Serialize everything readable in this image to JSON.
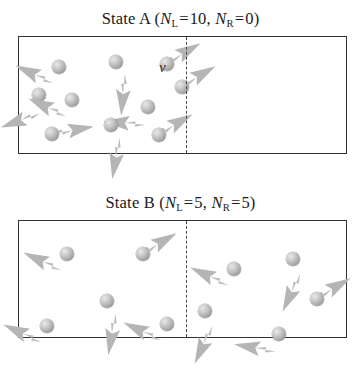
{
  "figure": {
    "background_color": "#ffffff",
    "box_border_color": "#333333",
    "divider_style": "dashed",
    "particle_color": "#ababab",
    "arrow_color": "#b0b0b0"
  },
  "states": [
    {
      "id": "state-a",
      "title": {
        "prefix": "State A (",
        "n_symbol": "N",
        "left_sub": "L",
        "equals": "=",
        "left_count": "10",
        "comma": ", ",
        "right_sub": "R",
        "right_count": "0",
        "suffix": ")"
      },
      "velocity_label": "v",
      "left_particles": [
        {
          "x": 40,
          "y": 30,
          "angle": 205
        },
        {
          "x": 97,
          "y": 25,
          "angle": 95
        },
        {
          "x": 148,
          "y": 27,
          "angle": 330
        },
        {
          "x": 20,
          "y": 58,
          "angle": 160
        },
        {
          "x": 53,
          "y": 63,
          "angle": 205
        },
        {
          "x": 129,
          "y": 70,
          "angle": 185
        },
        {
          "x": 163,
          "y": 50,
          "angle": 330
        },
        {
          "x": 33,
          "y": 97,
          "angle": 350
        },
        {
          "x": 92,
          "y": 88,
          "angle": 100
        },
        {
          "x": 140,
          "y": 98,
          "angle": 330
        }
      ],
      "right_particles": []
    },
    {
      "id": "state-b",
      "title": {
        "prefix": "State B (",
        "n_symbol": "N",
        "left_sub": "L",
        "equals": "=",
        "left_count": "5",
        "comma": ", ",
        "right_sub": "R",
        "right_count": "5",
        "suffix": ")"
      },
      "velocity_label": "",
      "left_particles": [
        {
          "x": 48,
          "y": 33,
          "angle": 205
        },
        {
          "x": 124,
          "y": 33,
          "angle": 330
        },
        {
          "x": 88,
          "y": 80,
          "angle": 100
        },
        {
          "x": 28,
          "y": 105,
          "angle": 205
        },
        {
          "x": 148,
          "y": 103,
          "angle": 205
        }
      ],
      "right_particles": [
        {
          "x": 48,
          "y": 48,
          "angle": 205
        },
        {
          "x": 107,
          "y": 38,
          "angle": 115
        },
        {
          "x": 19,
          "y": 90,
          "angle": 115
        },
        {
          "x": 131,
          "y": 78,
          "angle": 330
        },
        {
          "x": 93,
          "y": 113,
          "angle": 190
        }
      ]
    }
  ]
}
